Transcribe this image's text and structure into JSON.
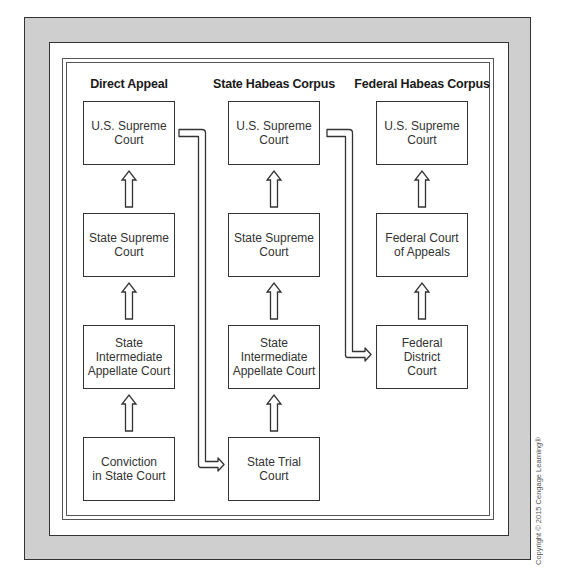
{
  "diagram": {
    "columns": [
      {
        "title": "Direct Appeal",
        "boxes": [
          "U.S. Supreme\nCourt",
          "State Supreme\nCourt",
          "State\nIntermediate\nAppellate Court",
          "Conviction\nin State Court"
        ]
      },
      {
        "title": "State Habeas Corpus",
        "boxes": [
          "U.S. Supreme\nCourt",
          "State Supreme\nCourt",
          "State\nIntermediate\nAppellate Court",
          "State Trial\nCourt"
        ]
      },
      {
        "title": "Federal Habeas Corpus",
        "boxes": [
          "U.S. Supreme\nCourt",
          "Federal Court\nof Appeals",
          "Federal\nDistrict\nCourt"
        ]
      }
    ],
    "connectors": [
      {
        "from": "Direct Appeal: U.S. Supreme Court",
        "to": "State Habeas Corpus: State Trial Court"
      },
      {
        "from": "State Habeas Corpus: U.S. Supreme Court",
        "to": "Federal Habeas Corpus: Federal District Court"
      }
    ],
    "arrow_direction": "up",
    "colors": {
      "frame": "#cfcfcf",
      "line": "#333333",
      "panel": "#ffffff"
    }
  },
  "copyright": "Copyright © 2015 Cengage Learning®"
}
